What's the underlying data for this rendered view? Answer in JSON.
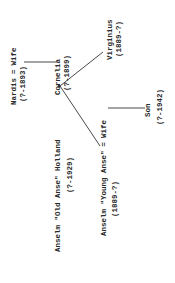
{
  "diagram": {
    "type": "family-tree",
    "orientation": "rotated-90-ccw",
    "people": {
      "nardis": {
        "name": "Nardis",
        "dates": "(?-1893)"
      },
      "nardis_wife": {
        "name": "Wife"
      },
      "marriage_year": "(1887)",
      "cornelia": {
        "name": "Cornelia",
        "dates": "(?-1899)"
      },
      "old_anse": {
        "name": "Anselm \"Old Anse\" Holland",
        "dates": "(?-1929)"
      },
      "virginius": {
        "name": "Virginius",
        "dates": "(1889-?)"
      },
      "young_anse": {
        "name": "Anselm \"Young Anse\"",
        "dates": "(1889-?)"
      },
      "young_anse_wife": {
        "name": "Wife"
      },
      "son": {
        "name": "Son",
        "dates": "(?-1942)"
      }
    },
    "marriage_symbol": "="
  }
}
